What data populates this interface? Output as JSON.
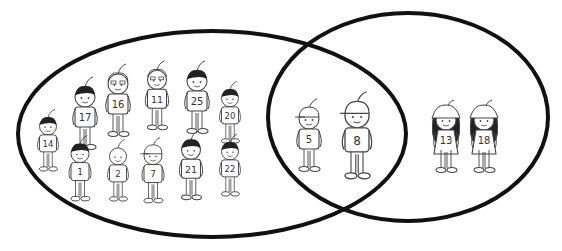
{
  "diagram": {
    "type": "venn",
    "sets": [
      {
        "id": "left",
        "label": "",
        "members_only": [
          "17",
          "16",
          "11",
          "25",
          "20",
          "14",
          "1",
          "2",
          "7",
          "21",
          "22"
        ]
      },
      {
        "id": "right",
        "label": "",
        "members_only": [
          "13",
          "18"
        ]
      }
    ],
    "intersection": [
      "5",
      "8"
    ],
    "colors": {
      "outline": "#111111",
      "background": "#ffffff",
      "sketch": "#444444"
    }
  },
  "kids": [
    {
      "num": "14",
      "x": 48,
      "y": 140,
      "scale": 0.85,
      "hair": "dark",
      "hat": "none"
    },
    {
      "num": "17",
      "x": 85,
      "y": 113,
      "scale": 1.0,
      "hair": "dark",
      "hat": "none"
    },
    {
      "num": "16",
      "x": 118,
      "y": 100,
      "scale": 1.0,
      "hair": "glasses",
      "hat": "none"
    },
    {
      "num": "11",
      "x": 157,
      "y": 95,
      "scale": 0.95,
      "hair": "glasses",
      "hat": "none"
    },
    {
      "num": "25",
      "x": 197,
      "y": 97,
      "scale": 1.0,
      "hair": "dark",
      "hat": "none"
    },
    {
      "num": "20",
      "x": 230,
      "y": 112,
      "scale": 0.85,
      "hair": "dark",
      "hat": "none"
    },
    {
      "num": "1",
      "x": 80,
      "y": 168,
      "scale": 0.9,
      "hair": "dark",
      "hat": "none"
    },
    {
      "num": "2",
      "x": 118,
      "y": 170,
      "scale": 0.85,
      "hair": "light",
      "hat": "none"
    },
    {
      "num": "7",
      "x": 153,
      "y": 170,
      "scale": 0.9,
      "hair": "light",
      "hat": "cap"
    },
    {
      "num": "21",
      "x": 191,
      "y": 165,
      "scale": 0.95,
      "hair": "dark",
      "hat": "none"
    },
    {
      "num": "22",
      "x": 230,
      "y": 165,
      "scale": 0.85,
      "hair": "dark",
      "hat": "none"
    },
    {
      "num": "5",
      "x": 309,
      "y": 135,
      "scale": 1.0,
      "hair": "light",
      "hat": "cap"
    },
    {
      "num": "8",
      "x": 357,
      "y": 135,
      "scale": 1.2,
      "hair": "light",
      "hat": "cap"
    },
    {
      "num": "13",
      "x": 446,
      "y": 136,
      "scale": 1.0,
      "hair": "long",
      "hat": "bucket"
    },
    {
      "num": "18",
      "x": 484,
      "y": 136,
      "scale": 1.0,
      "hair": "long",
      "hat": "bucket"
    }
  ]
}
